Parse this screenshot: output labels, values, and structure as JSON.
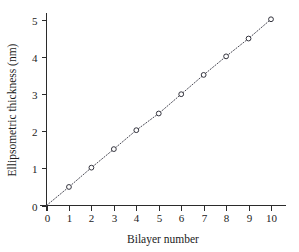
{
  "chart_data": {
    "type": "scatter",
    "title": "",
    "subtitle": "",
    "xlabel": "Bilayer number",
    "ylabel": "Ellipsometric thickness (nm)",
    "xlim": [
      0,
      10
    ],
    "ylim": [
      0,
      5
    ],
    "xticks": [
      0,
      1,
      2,
      3,
      4,
      5,
      6,
      7,
      8,
      9,
      10
    ],
    "xtick_labels": [
      "0",
      "1",
      "2",
      "3",
      "4",
      "5",
      "6",
      "7",
      "8",
      "9",
      "10"
    ],
    "yticks": [
      0,
      1,
      2,
      3,
      4,
      5
    ],
    "ytick_labels": [
      "0",
      "1",
      "2",
      "3",
      "4",
      "5"
    ],
    "grid": false,
    "legend": null,
    "legend_position": "none",
    "marker": "open-circle",
    "line_style": "dotted",
    "line_color": "#4a4a55",
    "marker_edge_color": "#33333d",
    "marker_face_color": "#ffffff",
    "axis_color": "#2b2b2b",
    "background_color": "#ffffff",
    "series": [
      {
        "name": "Ellipsometric thickness",
        "x": [
          0,
          1,
          2,
          3,
          4,
          5,
          6,
          7,
          8,
          9,
          10
        ],
        "values": [
          0.0,
          0.5,
          1.02,
          1.52,
          2.03,
          2.48,
          3.0,
          3.52,
          4.02,
          4.5,
          5.02
        ],
        "marker_shown_at": [
          1,
          2,
          3,
          4,
          5,
          6,
          7,
          8,
          9,
          10
        ]
      }
    ],
    "annotations": []
  }
}
